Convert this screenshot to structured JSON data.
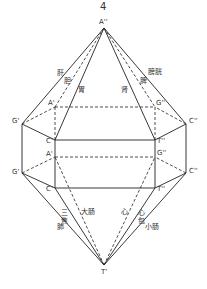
{
  "figure": {
    "number": "4",
    "vertices": {
      "apex_top": {
        "label": "A''",
        "x": 104,
        "y": 28
      },
      "a_upper": {
        "label": "A'",
        "x": 55,
        "y": 107
      },
      "g2_upper": {
        "label": "G''",
        "x": 155,
        "y": 107
      },
      "g1_upper": {
        "label": "G'",
        "x": 22,
        "y": 124
      },
      "c2_upper": {
        "label": "C''",
        "x": 186,
        "y": 124
      },
      "c1_upper": {
        "label": "C'",
        "x": 55,
        "y": 140
      },
      "t2_upper": {
        "label": "T''",
        "x": 155,
        "y": 140
      },
      "a_lower": {
        "label": "A'",
        "x": 55,
        "y": 157
      },
      "g2_lower": {
        "label": "G''",
        "x": 155,
        "y": 157
      },
      "g1_lower": {
        "label": "G'",
        "x": 22,
        "y": 173
      },
      "c2_lower": {
        "label": "C''",
        "x": 186,
        "y": 173
      },
      "c1_lower": {
        "label": "C'",
        "x": 55,
        "y": 188
      },
      "t2_lower": {
        "label": "T''",
        "x": 155,
        "y": 188
      },
      "apex_bottom": {
        "label": "T'",
        "x": 104,
        "y": 265
      }
    },
    "organ_labels": {
      "liver": "肝",
      "gallbladder": "胆",
      "stomach": "胃",
      "kidney": "肾",
      "spleen": "脾",
      "bladder": "膀胱",
      "triple_burner": "三焦",
      "lung": "肺",
      "large_intestine": "大肠",
      "heart": "心",
      "pericardium": "心包",
      "small_intestine": "小肠"
    }
  }
}
